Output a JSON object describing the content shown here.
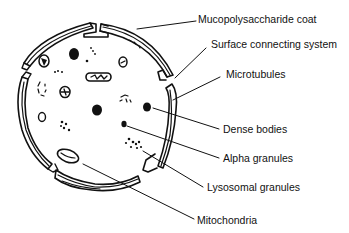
{
  "figure": {
    "ink_color": "#111111",
    "background_color": "#ffffff"
  },
  "labels": [
    {
      "id": "mucopolysaccharide-coat",
      "text": "Mucopolysaccharide coat"
    },
    {
      "id": "surface-connecting-system",
      "text": "Surface connecting system"
    },
    {
      "id": "microtubules",
      "text": "Microtubules"
    },
    {
      "id": "dense-bodies",
      "text": "Dense bodies"
    },
    {
      "id": "alpha-granules",
      "text": "Alpha granules"
    },
    {
      "id": "lysosomal-granules",
      "text": "Lysosomal granules"
    },
    {
      "id": "mitochondria",
      "text": "Mitochondria"
    }
  ]
}
